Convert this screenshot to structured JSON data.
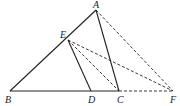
{
  "diagram": {
    "type": "geometry",
    "points": {
      "A": {
        "x": 96,
        "y": 10,
        "label": "A",
        "lx": 93,
        "ly": 8
      },
      "E": {
        "x": 68,
        "y": 40,
        "label": "E",
        "lx": 60,
        "ly": 38
      },
      "B": {
        "x": 10,
        "y": 91,
        "label": "B",
        "lx": 5,
        "ly": 103
      },
      "D": {
        "x": 91,
        "y": 91,
        "label": "D",
        "lx": 88,
        "ly": 103
      },
      "C": {
        "x": 119,
        "y": 91,
        "label": "C",
        "lx": 117,
        "ly": 103
      },
      "F": {
        "x": 173,
        "y": 91,
        "label": "F",
        "lx": 170,
        "ly": 103
      }
    },
    "solid_segments": [
      [
        "A",
        "B"
      ],
      [
        "B",
        "C"
      ],
      [
        "E",
        "D"
      ],
      [
        "A",
        "C"
      ]
    ],
    "dashed_segments": [
      [
        "A",
        "F"
      ],
      [
        "E",
        "F"
      ],
      [
        "E",
        "C"
      ],
      [
        "C",
        "F"
      ]
    ]
  }
}
